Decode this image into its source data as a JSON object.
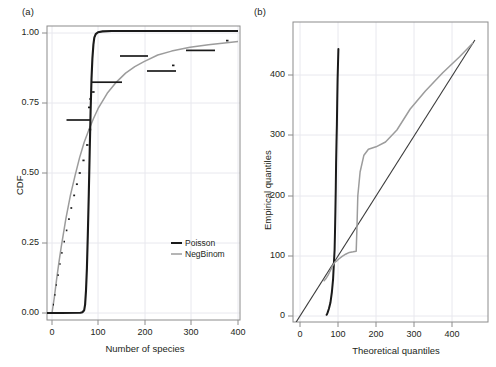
{
  "figure": {
    "panels": [
      {
        "label": "(a)",
        "xlabel": "Number of species",
        "ylabel": "CDF",
        "xticks": [
          "0",
          "100",
          "200",
          "300",
          "400"
        ],
        "yticks": [
          "0.00",
          "0.25",
          "0.50",
          "0.75",
          "1.00"
        ],
        "legend": [
          {
            "label": "Poisson",
            "color": "#1a1a1a"
          },
          {
            "label": "NegBinom",
            "color": "#9c9c9c"
          }
        ]
      },
      {
        "label": "(b)",
        "xlabel": "Theoretical quantiles",
        "ylabel": "Empirical quantiles",
        "xticks": [
          "0",
          "100",
          "200",
          "300",
          "400"
        ],
        "yticks": [
          "0",
          "100",
          "200",
          "300",
          "400"
        ]
      }
    ]
  },
  "colors": {
    "poisson": "#1a1a1a",
    "negbinom": "#9c9c9c",
    "empirical": "#1a1a1a",
    "reference_line": "#3a3a3a",
    "frame": "#8c8c8c",
    "grid": "#e8e8ee",
    "text": "#231f20"
  },
  "chart_data": [
    {
      "type": "line",
      "title": "",
      "panel": "(a)",
      "xlabel": "Number of species",
      "ylabel": "CDF",
      "xlim": [
        -15,
        470
      ],
      "ylim": [
        -0.04,
        1.04
      ],
      "xticks": [
        0,
        100,
        200,
        300,
        400
      ],
      "yticks": [
        0.0,
        0.25,
        0.5,
        0.75,
        1.0
      ],
      "grid": true,
      "legend_position": "bottom-right",
      "series": [
        {
          "name": "Poisson",
          "color": "#1a1a1a",
          "style": "solid",
          "x": [
            0,
            20,
            40,
            55,
            62,
            66,
            70,
            72,
            74,
            76,
            78,
            80,
            82,
            84,
            86,
            88,
            90,
            92,
            95,
            100,
            110,
            130,
            170,
            220,
            300,
            380,
            460
          ],
          "y": [
            0.0,
            0.0,
            0.0,
            0.0,
            0.001,
            0.003,
            0.01,
            0.03,
            0.08,
            0.16,
            0.28,
            0.43,
            0.58,
            0.72,
            0.83,
            0.9,
            0.945,
            0.97,
            0.988,
            0.997,
            0.9995,
            1.0,
            1.0,
            1.0,
            1.0,
            1.0,
            1.0
          ]
        },
        {
          "name": "NegBinom",
          "color": "#9c9c9c",
          "style": "solid",
          "x": [
            0,
            5,
            10,
            15,
            20,
            30,
            40,
            50,
            60,
            70,
            80,
            90,
            100,
            120,
            140,
            160,
            180,
            200,
            230,
            260,
            300,
            340,
            380,
            420,
            460
          ],
          "y": [
            0.0,
            0.055,
            0.12,
            0.18,
            0.235,
            0.335,
            0.42,
            0.49,
            0.555,
            0.61,
            0.655,
            0.695,
            0.73,
            0.785,
            0.825,
            0.857,
            0.88,
            0.898,
            0.918,
            0.932,
            0.946,
            0.955,
            0.962,
            0.966,
            0.969
          ]
        },
        {
          "name": "Empirical ECDF",
          "color": "#1a1a1a",
          "style": "step-dots",
          "x": [
            3,
            6,
            9,
            12,
            16,
            20,
            25,
            30,
            35,
            40,
            46,
            52,
            58,
            66,
            74,
            80,
            84,
            88,
            92,
            97,
            150,
            215,
            270,
            300,
            350,
            440
          ],
          "y": [
            0.03,
            0.065,
            0.1,
            0.135,
            0.175,
            0.215,
            0.255,
            0.295,
            0.335,
            0.375,
            0.42,
            0.46,
            0.5,
            0.545,
            0.6,
            0.655,
            0.69,
            0.735,
            0.765,
            0.79,
            0.825,
            0.865,
            0.885,
            0.9,
            0.93,
            0.965
          ]
        }
      ]
    },
    {
      "type": "line",
      "title": "",
      "panel": "(b)",
      "xlabel": "Theoretical quantiles",
      "ylabel": "Empirical quantiles",
      "xlim": [
        -35,
        470
      ],
      "ylim": [
        -25,
        470
      ],
      "xticks": [
        0,
        100,
        200,
        300,
        400
      ],
      "yticks": [
        0,
        100,
        200,
        300,
        400
      ],
      "grid": true,
      "series": [
        {
          "name": "Reference line (y = x)",
          "color": "#3a3a3a",
          "style": "solid-thin",
          "x": [
            -30,
            460
          ],
          "y": [
            -30,
            460
          ]
        },
        {
          "name": "Poisson",
          "color": "#1a1a1a",
          "style": "solid",
          "x": [
            70,
            71,
            73,
            76,
            80,
            84,
            87,
            89,
            91,
            92,
            93,
            94,
            95,
            96,
            97,
            98,
            99,
            100,
            101
          ],
          "y": [
            2,
            3,
            6,
            12,
            22,
            40,
            62,
            85,
            110,
            140,
            175,
            215,
            255,
            290,
            320,
            355,
            395,
            420,
            445
          ]
        },
        {
          "name": "NegBinom",
          "color": "#9c9c9c",
          "style": "solid",
          "x": [
            62,
            68,
            74,
            80,
            86,
            92,
            97,
            102,
            110,
            120,
            130,
            140,
            148,
            150,
            152,
            158,
            168,
            180,
            200,
            225,
            255,
            290,
            330,
            375,
            420,
            455
          ],
          "y": [
            58,
            62,
            68,
            76,
            84,
            90,
            92,
            95,
            99,
            103,
            106,
            107,
            108,
            150,
            200,
            240,
            268,
            278,
            282,
            290,
            310,
            345,
            375,
            405,
            432,
            455
          ]
        }
      ]
    }
  ]
}
